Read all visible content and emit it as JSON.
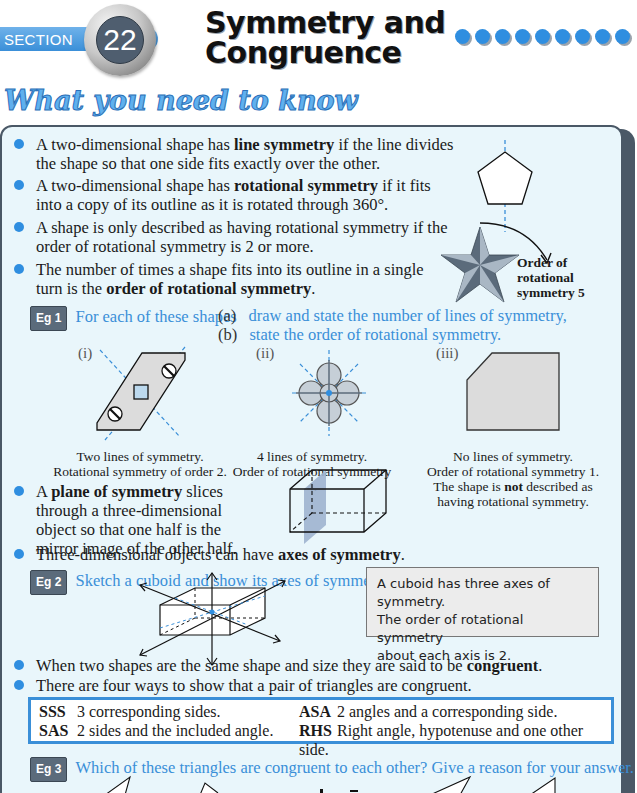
{
  "header": {
    "section_label": "SECTION",
    "section_number": "22",
    "title_line1": "Symmetry and",
    "title_line2": "Congruence",
    "decoration_dot_count": 9,
    "accent_color": "#2f8ee0"
  },
  "heading": "What you need to know",
  "bullets": [
    {
      "pre": "A two-dimensional shape has ",
      "bold": "line symmetry",
      "post": " if the line divides the shape so that one side fits exactly over the other."
    },
    {
      "pre": "A two-dimensional shape has ",
      "bold": "rotational symmetry",
      "post": " if it fits into a copy of its outline as it is rotated through 360°."
    },
    {
      "pre": "A shape is only described as having rotational symmetry if the order of rotational symmetry is 2 or more.",
      "bold": "",
      "post": ""
    },
    {
      "pre": "The number of times a shape fits into its outline in a single turn is the ",
      "bold": "order of rotational symmetry",
      "post": "."
    },
    {
      "pre": "A ",
      "bold": "plane of symmetry",
      "post": " slices through a three-dimensional object so that one half is the mirror image of the other half."
    },
    {
      "pre": "Three-dimensional objects can have ",
      "bold": "axes of symmetry",
      "post": "."
    },
    {
      "pre": "When two shapes are the same shape and size they are said to be ",
      "bold": "congruent",
      "post": "."
    },
    {
      "pre": "There are four ways to show that a pair of triangles are congruent.",
      "bold": "",
      "post": ""
    }
  ],
  "star_figure": {
    "label_line1": "Order of",
    "label_line2": "rotational",
    "label_line3": "symmetry 5"
  },
  "eg1": {
    "tag": "Eg 1",
    "prompt": "For each of these shapes",
    "part_a_label": "(a)",
    "part_a": "draw and state the number of lines of symmetry,",
    "part_b_label": "(b)",
    "part_b": "state the order of rotational symmetry.",
    "shapes": [
      {
        "label": "(i)",
        "caption_line1": "Two lines of symmetry.",
        "caption_line2": "Rotational symmetry of order 2."
      },
      {
        "label": "(ii)",
        "caption_line1": "4 lines of symmetry.",
        "caption_line2": "Order of rotational symmetry 4."
      },
      {
        "label": "(iii)",
        "caption_line1": "No lines of symmetry.",
        "caption_line2": "Order of rotational symmetry 1.",
        "caption_line3_pre": "The shape is ",
        "caption_line3_bold": "not",
        "caption_line3_post": " described as",
        "caption_line4": "having rotational symmetry."
      }
    ]
  },
  "eg2": {
    "tag": "Eg 2",
    "prompt": "Sketch a cuboid and show its axes of symmetry.",
    "note_line1": "A cuboid has three axes of symmetry.",
    "note_line2": "The order of rotational symmetry",
    "note_line3": "about each axis is 2."
  },
  "criteria": [
    {
      "code": "SSS",
      "text": "3 corresponding sides."
    },
    {
      "code": "SAS",
      "text": "2 sides and the included angle."
    },
    {
      "code": "ASA",
      "text": "2 angles and a corresponding side."
    },
    {
      "code": "RHS",
      "text": "Right angle, hypotenuse and one other side."
    }
  ],
  "eg3": {
    "tag": "Eg 3",
    "prompt": "Which of these triangles are congruent to each other? Give a reason for your answer."
  }
}
